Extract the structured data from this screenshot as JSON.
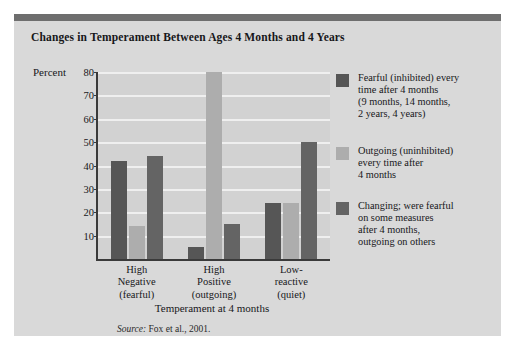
{
  "figure": {
    "title": "Changes in Temperament Between Ages 4 Months and 4 Years",
    "source": "Source: Fox et al., 2001.",
    "source_prefix": "Source:",
    "source_rest": " Fox et al., 2001.",
    "accent_bar_color": "#6e6e6e",
    "panel_color": "#d9d9d9",
    "plot_color": "#d2d2d2"
  },
  "chart_data": {
    "type": "bar",
    "title": "Changes in Temperament Between Ages 4 Months and 4 Years",
    "xlabel": "Temperament at 4 months",
    "ylabel": "Percent",
    "ylim": [
      0,
      80
    ],
    "yticks": [
      10,
      20,
      30,
      40,
      50,
      60,
      70,
      80
    ],
    "grid": true,
    "legend_position": "right",
    "categories": [
      "High\nNegative\n(fearful)",
      "High\nPositive\n(outgoing)",
      "Low-\nreactive\n(quiet)"
    ],
    "category_lines": [
      [
        "High",
        "Negative",
        "(fearful)"
      ],
      [
        "High",
        "Positive",
        "(outgoing)"
      ],
      [
        "Low-",
        "reactive",
        "(quiet)"
      ]
    ],
    "series": [
      {
        "name": "Fearful (inhibited) every time after 4 months (9 months, 14 months, 2 years, 4 years)",
        "color": "#565656",
        "values": [
          42,
          5,
          24
        ]
      },
      {
        "name": "Outgoing (uninhibited) every time after 4 months",
        "color": "#adadad",
        "values": [
          14,
          80,
          24
        ]
      },
      {
        "name": "Changing; were fearful on some measures after 4 months, outgoing on others",
        "color": "#646464",
        "values": [
          44,
          15,
          50
        ]
      }
    ]
  },
  "legend": {
    "items": [
      {
        "swatch_color": "#565656",
        "lines": [
          "Fearful (inhibited) every",
          "time after 4 months",
          "(9 months, 14 months,",
          "2 years, 4 years)"
        ]
      },
      {
        "swatch_color": "#adadad",
        "lines": [
          "Outgoing (uninhibited)",
          "every time after",
          "4 months"
        ]
      },
      {
        "swatch_color": "#646464",
        "lines": [
          "Changing; were fearful",
          "on some measures",
          "after 4 months,",
          "outgoing on others"
        ]
      }
    ]
  }
}
